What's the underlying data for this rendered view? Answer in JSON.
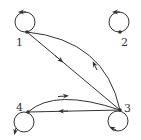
{
  "diagram": {
    "type": "directed-graph",
    "stroke_color": "#333333",
    "background": "#ffffff",
    "nodes": [
      {
        "id": "1",
        "label": "1",
        "x": 27,
        "y": 32,
        "self_loop": true
      },
      {
        "id": "2",
        "label": "2",
        "x": 120,
        "y": 32,
        "self_loop": true
      },
      {
        "id": "3",
        "label": "3",
        "x": 120,
        "y": 110,
        "self_loop": true
      },
      {
        "id": "4",
        "label": "4",
        "x": 28,
        "y": 112,
        "self_loop": true
      }
    ],
    "edges": [
      {
        "from": "1",
        "to": "1",
        "style": "loop"
      },
      {
        "from": "2",
        "to": "2",
        "style": "loop"
      },
      {
        "from": "3",
        "to": "3",
        "style": "loop"
      },
      {
        "from": "4",
        "to": "4",
        "style": "loop"
      },
      {
        "from": "1",
        "to": "3",
        "style": "straight"
      },
      {
        "from": "3",
        "to": "1",
        "style": "curved"
      },
      {
        "from": "3",
        "to": "4",
        "style": "straight"
      },
      {
        "from": "4",
        "to": "3",
        "style": "curved"
      }
    ]
  }
}
